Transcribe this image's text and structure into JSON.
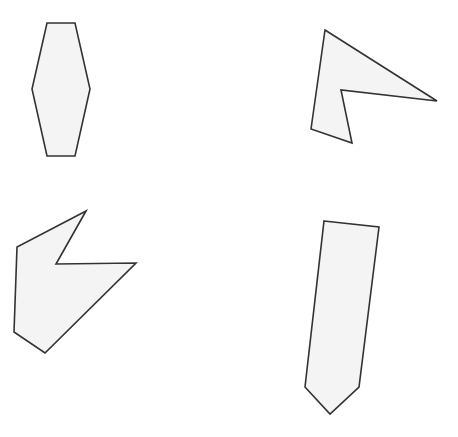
{
  "figure": {
    "fill_color": "#f4f4f4",
    "stroke_color": "#333333",
    "shapes": [
      {
        "name": "hexagon",
        "sides": 6
      },
      {
        "name": "concave-pentagon-arrowhead",
        "sides": 5
      },
      {
        "name": "concave-hexagon-notched",
        "sides": 6
      },
      {
        "name": "pentagon-tag",
        "sides": 5
      }
    ]
  }
}
